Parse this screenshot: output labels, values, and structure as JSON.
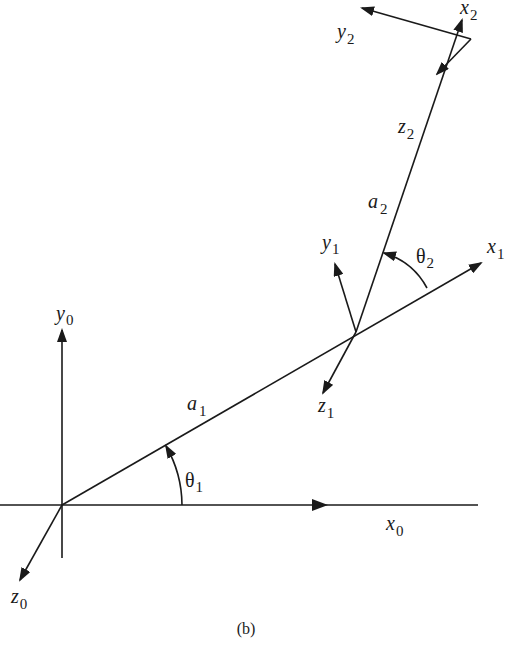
{
  "figure": {
    "caption": "(b)",
    "colors": {
      "ink": "#1a1a1a",
      "background": "#ffffff"
    }
  },
  "frames": {
    "frame0": {
      "x": "x",
      "x_sub": "0",
      "y": "y",
      "y_sub": "0",
      "z": "z",
      "z_sub": "0"
    },
    "frame1": {
      "x": "x",
      "x_sub": "1",
      "y": "y",
      "y_sub": "1",
      "z": "z",
      "z_sub": "1"
    },
    "frame2": {
      "x": "x",
      "x_sub": "2",
      "y": "y",
      "y_sub": "2",
      "z": "z",
      "z_sub": "2"
    }
  },
  "links": {
    "link1": {
      "name": "a",
      "sub": "1"
    },
    "link2": {
      "name": "a",
      "sub": "2"
    }
  },
  "joints": {
    "theta1": {
      "name": "θ",
      "sub": "1"
    },
    "theta2": {
      "name": "θ",
      "sub": "2"
    }
  }
}
